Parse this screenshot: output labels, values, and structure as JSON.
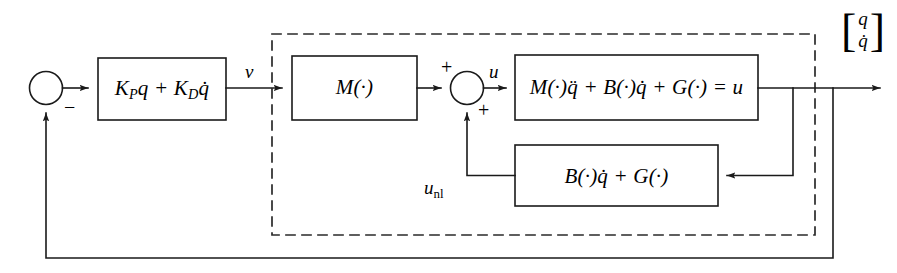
{
  "diagram": {
    "blocks": {
      "pd_controller": {
        "name": "pd-controller-block",
        "text_html": "K<span class=\"sub\">P</span>q + K<span class=\"sub\">D</span>q̇",
        "plain": "K_P q + K_D q̇"
      },
      "inertia": {
        "name": "inertia-block",
        "text_html": "M(·)",
        "plain": "M(·)"
      },
      "plant": {
        "name": "plant-dynamics-block",
        "text_html": "M(·)q̈ + B(·)q̇ + G(·) = u",
        "plain": "M(·)q̈ + B(·)q̇ + G(·) = u"
      },
      "nonlinear": {
        "name": "nonlinear-compensation-block",
        "text_html": "B(·)q̇ + G(·)",
        "plain": "B(·)q̇ + G(·)"
      }
    },
    "signals": {
      "v": "ν",
      "u": "u",
      "u_nl_html": "u<span class=\"sub-up\">nl</span>",
      "u_nl_plain": "u_nl",
      "output_row1": "q",
      "output_row2": "q̇",
      "bracket_left": "[",
      "bracket_right": "]"
    },
    "signs": {
      "error_negative": "−",
      "sum_top_positive": "+",
      "sum_bottom_positive": "+"
    },
    "junctions": {
      "error_junction": "error-summing-junction",
      "torque_junction": "torque-summing-junction"
    },
    "regions": {
      "dashed_boundary": "inner-control-law-boundary"
    },
    "colors": {
      "line": "#1a1a1a",
      "background": "#ffffff",
      "dash": "#2a2a2a"
    }
  }
}
